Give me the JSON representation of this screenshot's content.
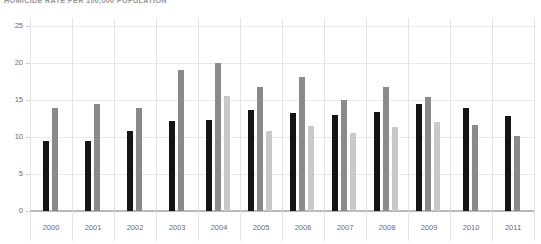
{
  "chart_data": {
    "type": "bar",
    "title": "HOMICIDE RATE PER 100,000 POPULATION",
    "xlabel": "",
    "ylabel": "",
    "ylim": [
      0,
      25
    ],
    "yticks": [
      0,
      5,
      10,
      15,
      20,
      25
    ],
    "grid": true,
    "legend": "none",
    "categories": [
      "2000",
      "2001",
      "2002",
      "2003",
      "2004",
      "2005",
      "2006",
      "2007",
      "2008",
      "2009",
      "2010",
      "2011"
    ],
    "series": [
      {
        "name": "series-1-black",
        "color": "#141414",
        "values": [
          9.5,
          9.4,
          10.8,
          12.2,
          12.3,
          13.7,
          13.3,
          13.0,
          13.4,
          14.4,
          13.9,
          12.9
        ]
      },
      {
        "name": "series-2-dark-gray",
        "color": "#8a8a8a",
        "values": [
          13.9,
          14.5,
          13.9,
          19.1,
          20.0,
          16.8,
          18.1,
          15.0,
          16.8,
          15.4,
          11.6,
          10.1
        ]
      },
      {
        "name": "series-3-light-gray",
        "color": "#c9c9c9",
        "values": [
          null,
          null,
          null,
          null,
          15.5,
          10.8,
          11.5,
          10.6,
          11.4,
          12.0,
          null,
          null
        ]
      }
    ]
  },
  "axis": {
    "y_tick_labels": [
      "0",
      "5",
      "10",
      "15",
      "20",
      "25"
    ],
    "x_tick_labels": [
      "2000",
      "2001",
      "2002",
      "2003",
      "2004",
      "2005",
      "2006",
      "2007",
      "2008",
      "2009",
      "2010",
      "2011"
    ]
  }
}
